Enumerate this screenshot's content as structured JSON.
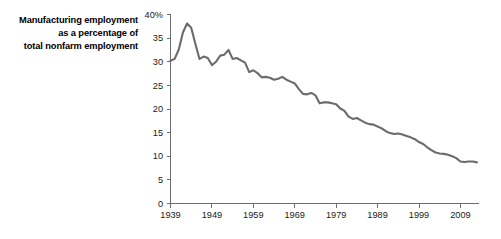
{
  "title": {
    "lines": [
      "Manufacturing employment",
      "as a percentage of",
      "total nonfarm employment"
    ]
  },
  "axes": {
    "y_unit_label": "40%",
    "y_ticks": [
      "0",
      "5",
      "10",
      "15",
      "20",
      "25",
      "30",
      "35",
      "40%"
    ],
    "x_ticks": [
      "1939",
      "1949",
      "1959",
      "1969",
      "1979",
      "1989",
      "1999",
      "2009"
    ]
  },
  "colors": {
    "line": "#6b6b6b",
    "axis": "#6e6e6e",
    "text": "#1a1a1a",
    "background": "#ffffff"
  },
  "chart_data": {
    "type": "line",
    "title": "Manufacturing employment as a percentage of total nonfarm employment",
    "xlabel": "",
    "ylabel": "",
    "xlim": [
      1939,
      2013
    ],
    "ylim": [
      0,
      40
    ],
    "grid": false,
    "legend": null,
    "x_tick_values": [
      1939,
      1949,
      1959,
      1969,
      1979,
      1989,
      1999,
      2009
    ],
    "y_tick_values": [
      0,
      5,
      10,
      15,
      20,
      25,
      30,
      35,
      40
    ],
    "series": [
      {
        "name": "Manufacturing share of nonfarm employment",
        "color": "#6b6b6b",
        "x": [
          1939,
          1940,
          1941,
          1942,
          1943,
          1944,
          1945,
          1946,
          1947,
          1948,
          1949,
          1950,
          1951,
          1952,
          1953,
          1954,
          1955,
          1956,
          1957,
          1958,
          1959,
          1960,
          1961,
          1962,
          1963,
          1964,
          1965,
          1966,
          1967,
          1968,
          1969,
          1970,
          1971,
          1972,
          1973,
          1974,
          1975,
          1976,
          1977,
          1978,
          1979,
          1980,
          1981,
          1982,
          1983,
          1984,
          1985,
          1986,
          1987,
          1988,
          1989,
          1990,
          1991,
          1992,
          1993,
          1994,
          1995,
          1996,
          1997,
          1998,
          1999,
          2000,
          2001,
          2002,
          2003,
          2004,
          2005,
          2006,
          2007,
          2008,
          2009,
          2010,
          2011,
          2012,
          2013
        ],
        "y": [
          30.2,
          30.6,
          32.6,
          36.2,
          38.1,
          37.2,
          33.8,
          30.6,
          31.1,
          30.8,
          29.3,
          30.0,
          31.3,
          31.5,
          32.5,
          30.6,
          30.8,
          30.3,
          29.8,
          27.8,
          28.2,
          27.6,
          26.7,
          26.8,
          26.6,
          26.2,
          26.4,
          26.8,
          26.2,
          25.8,
          25.4,
          24.2,
          23.2,
          23.1,
          23.4,
          22.9,
          21.2,
          21.4,
          21.4,
          21.2,
          21.0,
          20.1,
          19.6,
          18.4,
          17.9,
          18.1,
          17.6,
          17.1,
          16.8,
          16.7,
          16.3,
          15.9,
          15.3,
          14.9,
          14.7,
          14.8,
          14.6,
          14.3,
          14.0,
          13.6,
          13.0,
          12.6,
          11.9,
          11.3,
          10.8,
          10.6,
          10.5,
          10.3,
          10.0,
          9.6,
          8.9,
          8.8,
          8.9,
          8.9,
          8.7
        ]
      }
    ]
  }
}
